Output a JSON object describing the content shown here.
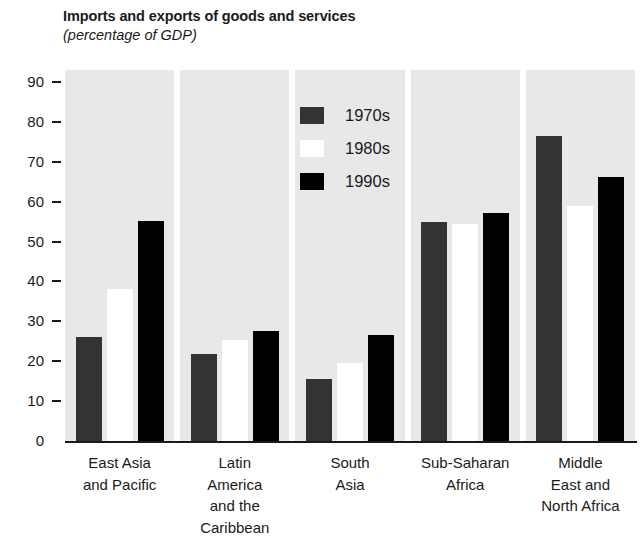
{
  "chart_data": {
    "type": "bar",
    "title": "Imports and exports of goods and services",
    "subtitle": "(percentage of GDP)",
    "xlabel": "",
    "ylabel": "",
    "ylim": [
      0,
      90
    ],
    "yticks": [
      0,
      10,
      20,
      30,
      40,
      50,
      60,
      70,
      80,
      90
    ],
    "ytick_labels": [
      "0",
      "10",
      "20",
      "30",
      "40",
      "50",
      "60",
      "70",
      "80",
      "90"
    ],
    "grid": false,
    "legend_position": "upper-center",
    "categories": [
      "East Asia and Pacific",
      "Latin America and the Caribbean",
      "South Asia",
      "Sub-Saharan Africa",
      "Middle East and North Africa"
    ],
    "category_label_lines": [
      [
        "East Asia",
        "and Pacific"
      ],
      [
        "Latin",
        "America",
        "and the",
        "Caribbean"
      ],
      [
        "South",
        "Asia"
      ],
      [
        "Sub-Saharan",
        "Africa"
      ],
      [
        "Middle",
        "East and",
        "North Africa"
      ]
    ],
    "series": [
      {
        "name": "1970s",
        "color": "#333333",
        "values": [
          26.0,
          21.7,
          15.6,
          54.9,
          76.4
        ]
      },
      {
        "name": "1980s",
        "color": "#ffffff",
        "values": [
          38.0,
          25.4,
          19.5,
          54.3,
          59.0
        ]
      },
      {
        "name": "1990s",
        "color": "#000000",
        "values": [
          55.1,
          27.7,
          26.6,
          57.2,
          66.1
        ]
      }
    ]
  },
  "legend": {
    "items": [
      {
        "label": "1970s",
        "swatch": "s1970"
      },
      {
        "label": "1980s",
        "swatch": "s1980"
      },
      {
        "label": "1990s",
        "swatch": "s1990"
      }
    ]
  }
}
